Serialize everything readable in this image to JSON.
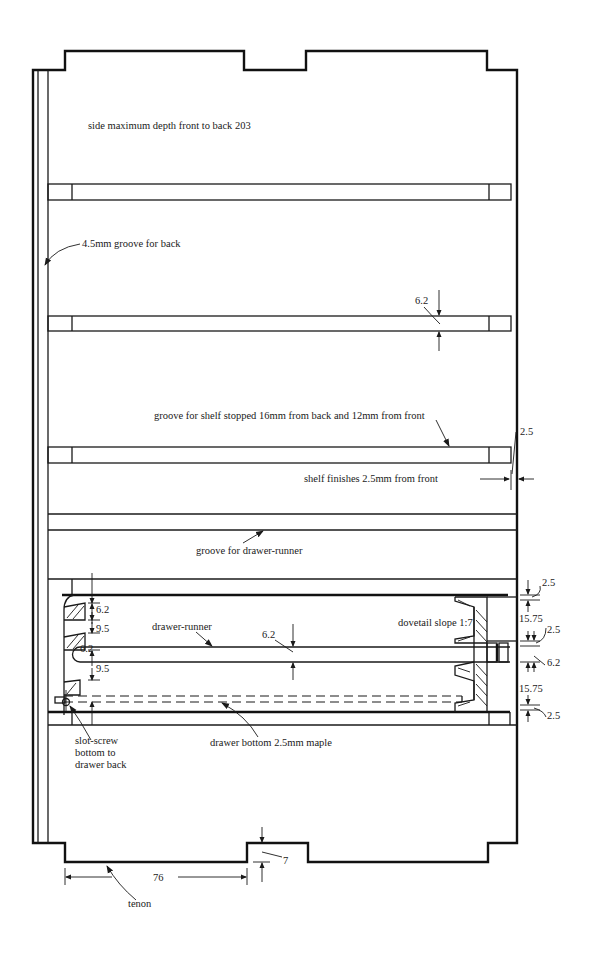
{
  "diagram": {
    "title": "side maximum depth front to back 203",
    "labels": {
      "side_depth": "side maximum depth front to back 203",
      "back_groove": "4.5mm groove for back",
      "shelf_groove_thickness": "6.2",
      "shelf_groove_stopped": "groove for shelf stopped 16mm from back and 12mm from front",
      "shelf_finish_dim": "2.5",
      "shelf_finishes": "shelf finishes 2.5mm from front",
      "runner_groove": "groove for drawer-runner",
      "drawer_top_gap": "6.2",
      "drawer_gap_1": "9.5",
      "drawer_groove_left": "6.2",
      "drawer_gap_2": "9.5",
      "drawer_runner": "drawer-runner",
      "drawer_runner_thickness": "6.2",
      "dovetail_slope": "dovetail slope 1:7",
      "right_dim_1": "2.5",
      "right_dim_2": "15.75",
      "right_dim_3": "2.5",
      "right_dim_4": "6.2",
      "right_dim_5": "15.75",
      "right_dim_6": "2.5",
      "slot_screw": "slot-screw\nbottom to\ndrawer back",
      "drawer_bottom": "drawer bottom 2.5mm maple",
      "tenon_length": "76",
      "tenon_depth": "7",
      "tenon": "tenon"
    }
  }
}
